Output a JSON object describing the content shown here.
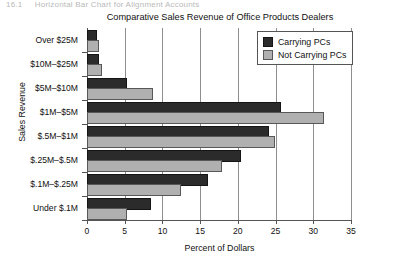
{
  "page_header": {
    "number": "16.1",
    "caption": "Horizontal Bar Chart for Alignment Accounts"
  },
  "legend": {
    "position": "top-right-inside",
    "items": [
      {
        "label": "Carrying PCs",
        "swatch": "dark-square-icon",
        "color": "#2b2b2b"
      },
      {
        "label": "Not Carrying PCs",
        "swatch": "light-square-icon",
        "color": "#b0b0b0"
      }
    ]
  },
  "chart_data": {
    "type": "bar",
    "orientation": "horizontal",
    "title": "Comparative Sales Revenue of Office Products Dealers",
    "xlabel": "Percent of Dollars",
    "ylabel": "Sales Revenue",
    "categories": [
      "Over $25M",
      "$10M–$25M",
      "$5M–$10M",
      "$1M–$5M",
      "$.5M–$1M",
      "$.25M–$.5M",
      "$.1M–$.25M",
      "Under $.1M"
    ],
    "series": [
      {
        "name": "Carrying PCs",
        "color": "#2b2b2b",
        "values": [
          1.0,
          1.3,
          5.0,
          25.5,
          23.8,
          20.2,
          15.8,
          8.2
        ]
      },
      {
        "name": "Not Carrying PCs",
        "color": "#b0b0b0",
        "values": [
          1.3,
          1.7,
          8.5,
          31.2,
          24.7,
          17.6,
          12.2,
          5.0
        ]
      }
    ],
    "xlim": [
      0,
      35
    ],
    "xticks": [
      0,
      5,
      10,
      15,
      20,
      25,
      30,
      35
    ],
    "xtick_labels": [
      "0",
      "5",
      "10",
      "15",
      "20",
      "25",
      "30",
      "35"
    ],
    "grid": "vertical-only",
    "legend_position": "upper right"
  }
}
